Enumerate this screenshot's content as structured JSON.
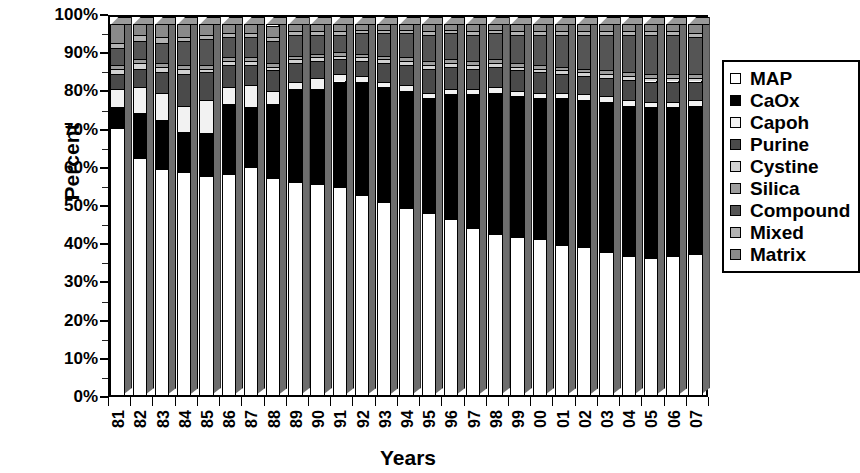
{
  "chart_data": {
    "type": "bar",
    "subtype": "stacked-percentage-3d",
    "title": "",
    "xlabel": "Years",
    "ylabel": "Percent",
    "ylim": [
      0,
      100
    ],
    "ytick_labels": [
      "0%",
      "10%",
      "20%",
      "30%",
      "40%",
      "50%",
      "60%",
      "70%",
      "80%",
      "90%",
      "100%"
    ],
    "ytick_values": [
      0,
      10,
      20,
      30,
      40,
      50,
      60,
      70,
      80,
      90,
      100
    ],
    "grid": false,
    "legend_position": "right",
    "categories": [
      "81",
      "82",
      "83",
      "84",
      "85",
      "86",
      "87",
      "88",
      "89",
      "90",
      "91",
      "92",
      "93",
      "94",
      "95",
      "96",
      "97",
      "98",
      "99",
      "00",
      "01",
      "02",
      "03",
      "04",
      "05",
      "06",
      "07"
    ],
    "stack_order_bottom_to_top": [
      "Matrix",
      "Mixed",
      "Compound",
      "Silica",
      "Cystine",
      "Purine",
      "Capoh",
      "CaOx",
      "MAP"
    ],
    "series": [
      {
        "name": "Matrix",
        "color": "#8a8a8a",
        "values": [
          5.0,
          3.0,
          3.5,
          3.5,
          3.0,
          2.5,
          2.5,
          3.0,
          2.0,
          2.0,
          2.0,
          1.5,
          1.5,
          1.5,
          2.0,
          1.5,
          2.0,
          1.5,
          2.0,
          2.0,
          2.0,
          2.0,
          2.0,
          2.0,
          2.0,
          2.0,
          2.5
        ]
      },
      {
        "name": "Mixed",
        "color": "#b3b3b3",
        "values": [
          1.5,
          1.5,
          1.5,
          1.0,
          1.0,
          1.0,
          1.0,
          1.0,
          1.0,
          1.0,
          1.0,
          1.0,
          1.0,
          1.0,
          1.0,
          1.0,
          1.0,
          1.0,
          1.0,
          1.0,
          1.0,
          1.0,
          1.0,
          1.0,
          1.0,
          1.0,
          1.0
        ]
      },
      {
        "name": "Compound",
        "color": "#555555",
        "values": [
          4.5,
          5.0,
          5.5,
          6.5,
          7.0,
          5.5,
          5.5,
          6.0,
          5.5,
          5.0,
          4.5,
          5.5,
          6.0,
          6.5,
          7.0,
          7.0,
          7.0,
          7.0,
          7.5,
          8.0,
          8.5,
          9.0,
          9.5,
          10.0,
          10.5,
          10.5,
          10.0
        ]
      },
      {
        "name": "Silica",
        "color": "#9d9d9d",
        "values": [
          1.0,
          1.0,
          1.0,
          1.0,
          1.0,
          1.0,
          1.0,
          1.0,
          1.0,
          1.0,
          1.0,
          1.0,
          1.0,
          1.0,
          1.0,
          1.0,
          1.0,
          1.0,
          1.0,
          1.0,
          1.0,
          1.0,
          1.0,
          1.0,
          1.0,
          1.0,
          1.0
        ]
      },
      {
        "name": "Cystine",
        "color": "#d2d2d2",
        "values": [
          1.5,
          1.5,
          1.5,
          1.5,
          1.0,
          1.0,
          1.0,
          1.0,
          1.0,
          1.0,
          1.0,
          1.0,
          1.0,
          1.0,
          1.0,
          1.0,
          1.0,
          1.0,
          1.0,
          1.0,
          1.0,
          1.0,
          1.0,
          1.0,
          1.0,
          1.0,
          1.0
        ]
      },
      {
        "name": "Purine",
        "color": "#4a4a4a",
        "values": [
          4.0,
          5.0,
          5.5,
          8.5,
          7.5,
          6.0,
          5.5,
          5.5,
          5.0,
          4.5,
          4.0,
          4.0,
          5.0,
          5.5,
          6.5,
          6.0,
          5.5,
          5.5,
          5.5,
          5.5,
          5.0,
          5.0,
          5.0,
          5.5,
          5.5,
          5.5,
          5.0
        ]
      },
      {
        "name": "Capoh",
        "color": "#f2f2f2",
        "values": [
          5.0,
          7.0,
          7.5,
          7.0,
          9.0,
          4.5,
          6.0,
          3.5,
          2.0,
          3.0,
          2.0,
          1.5,
          1.5,
          1.5,
          1.5,
          1.5,
          1.5,
          1.5,
          1.5,
          1.5,
          1.5,
          1.5,
          1.5,
          1.5,
          1.5,
          1.5,
          1.5
        ]
      },
      {
        "name": "CaOx",
        "color": "#000000",
        "values": [
          5.5,
          12.0,
          13.0,
          11.0,
          11.5,
          19.0,
          16.0,
          20.0,
          25.0,
          25.5,
          28.5,
          30.5,
          31.0,
          31.5,
          31.0,
          33.5,
          36.0,
          38.0,
          38.0,
          38.0,
          39.5,
          39.5,
          40.5,
          40.5,
          40.5,
          40.0,
          40.0
        ]
      },
      {
        "name": "MAP",
        "color": "#ffffff",
        "values": [
          72.0,
          64.0,
          61.0,
          60.0,
          59.0,
          59.5,
          61.5,
          58.5,
          57.5,
          57.0,
          56.0,
          54.0,
          52.0,
          50.5,
          49.0,
          47.5,
          45.0,
          43.5,
          42.5,
          42.0,
          40.5,
          40.0,
          38.5,
          37.5,
          37.0,
          37.5,
          38.0
        ]
      }
    ],
    "cumulative_top_of_caox_percent": [
      22.0,
      36.0,
      39.0,
      40.0,
      41.0,
      40.5,
      38.5,
      41.5,
      42.5,
      43.0,
      44.0,
      46.0,
      48.0,
      49.5,
      51.0,
      52.5,
      55.0,
      56.5,
      57.5,
      58.0,
      59.5,
      60.0,
      61.5,
      62.5,
      63.0,
      62.5,
      62.0
    ]
  },
  "legend": {
    "items": [
      {
        "label": "MAP",
        "swatch": "#ffffff"
      },
      {
        "label": "CaOx",
        "swatch": "#000000"
      },
      {
        "label": "Capoh",
        "swatch": "#f2f2f2"
      },
      {
        "label": "Purine",
        "swatch": "#4a4a4a"
      },
      {
        "label": "Cystine",
        "swatch": "#d2d2d2"
      },
      {
        "label": "Silica",
        "swatch": "#9d9d9d"
      },
      {
        "label": "Compound",
        "swatch": "#555555"
      },
      {
        "label": "Mixed",
        "swatch": "#b3b3b3"
      },
      {
        "label": "Matrix",
        "swatch": "#8a8a8a"
      }
    ]
  }
}
